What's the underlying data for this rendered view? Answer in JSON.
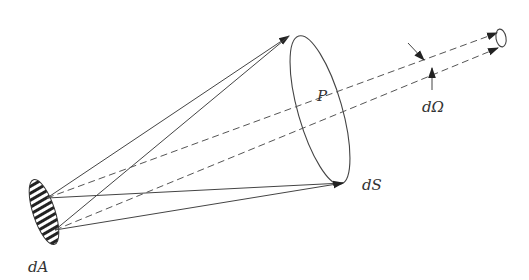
{
  "figure": {
    "type": "radiometry solid-angle diagram",
    "labels": {
      "source_area": "dA",
      "point": "P",
      "surface": "dS",
      "solid_angle": "dΩ"
    },
    "elements": [
      {
        "name": "source-disc",
        "description": "hatched elliptical source area dA",
        "hatched": true
      },
      {
        "name": "cone-rim",
        "description": "elliptical surface element dS with point P"
      },
      {
        "name": "solid-rays",
        "count": 4,
        "description": "solid arrows from dA to rim of dS"
      },
      {
        "name": "dashed-rays",
        "count": 2,
        "description": "dashed rays through P toward small distant cone"
      },
      {
        "name": "distant-cone",
        "description": "small ellipse at far end of dashed rays"
      },
      {
        "name": "solid-angle-markers",
        "count": 2,
        "description": "two arrows indicating dΩ spread"
      }
    ],
    "colors": {
      "line": "#444444",
      "text": "#333333",
      "background": "#ffffff"
    }
  }
}
